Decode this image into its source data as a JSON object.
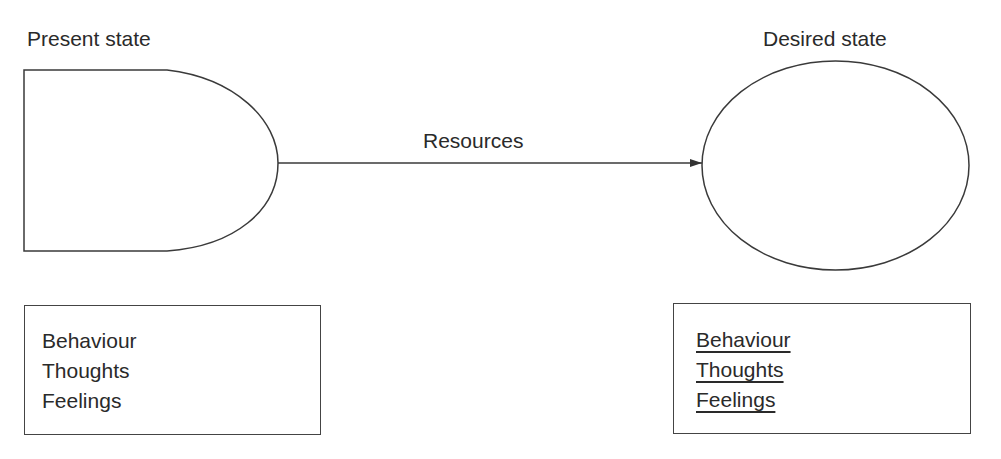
{
  "diagram": {
    "present_state": {
      "title": "Present state",
      "items": [
        "Behaviour",
        "Thoughts",
        "Feelings"
      ],
      "items_underlined": false
    },
    "connector": {
      "label": "Resources",
      "direction": "present-to-desired"
    },
    "desired_state": {
      "title": "Desired state",
      "items": [
        "Behaviour",
        "Thoughts",
        "Feelings"
      ],
      "items_underlined": true
    },
    "colors": {
      "stroke": "#3a3a3a",
      "text": "#2a2a2a",
      "background": "#ffffff"
    }
  }
}
